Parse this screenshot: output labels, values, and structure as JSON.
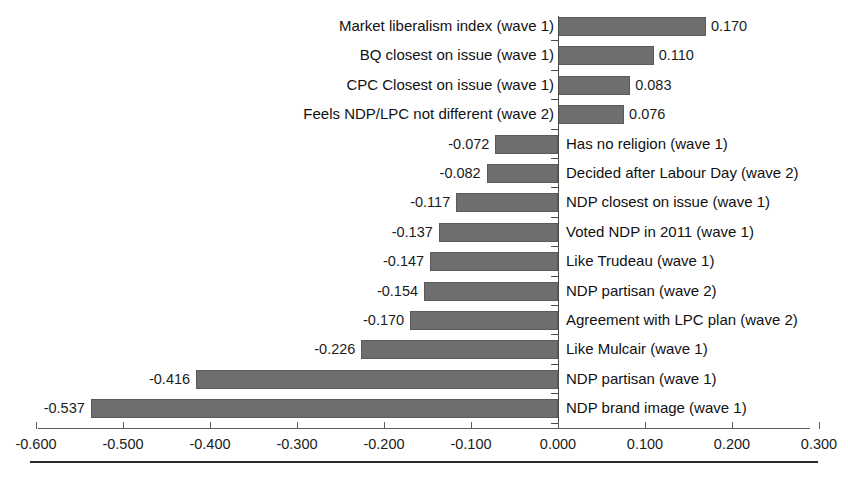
{
  "chart_data": {
    "type": "bar",
    "orientation": "horizontal",
    "title": "",
    "subtitle": "",
    "xlabel": "",
    "ylabel": "",
    "xlim": [
      -0.6,
      0.3
    ],
    "xticks": [
      "-0.600",
      "-0.500",
      "-0.400",
      "-0.300",
      "-0.200",
      "-0.100",
      "0.000",
      "0.100",
      "0.200",
      "0.300"
    ],
    "xtick_values": [
      -0.6,
      -0.5,
      -0.4,
      -0.3,
      -0.2,
      -0.1,
      0.0,
      0.1,
      0.2,
      0.3
    ],
    "grid": false,
    "legend": "none",
    "bar_color": "#6e6e6e",
    "axis_color": "#5d5d5d",
    "categories": [
      "Market liberalism index (wave 1)",
      "BQ closest on issue (wave 1)",
      "CPC Closest on issue (wave 1)",
      "Feels NDP/LPC not different (wave 2)",
      "Has no religion (wave 1)",
      "Decided after Labour Day (wave 2)",
      "NDP closest on issue (wave 1)",
      "Voted NDP in 2011 (wave 1)",
      "Like Trudeau (wave 1)",
      "NDP partisan (wave 2)",
      "Agreement with LPC plan (wave 2)",
      "Like Mulcair (wave 1)",
      "NDP partisan (wave 1)",
      "NDP brand image (wave 1)"
    ],
    "values": [
      0.17,
      0.11,
      0.083,
      0.076,
      -0.072,
      -0.082,
      -0.117,
      -0.137,
      -0.147,
      -0.154,
      -0.17,
      -0.226,
      -0.416,
      -0.537
    ],
    "value_labels": [
      "0.170",
      "0.110",
      "0.083",
      "0.076",
      "-0.072",
      "-0.082",
      "-0.117",
      "-0.137",
      "-0.147",
      "-0.154",
      "-0.170",
      "-0.226",
      "-0.416",
      "-0.537"
    ]
  }
}
